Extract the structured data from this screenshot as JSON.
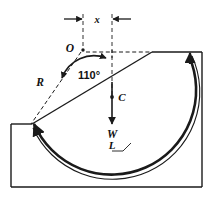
{
  "figure": {
    "name": "circular-slip-surface-diagram",
    "background_color": "#ffffff",
    "line_color": "#1a1a1a",
    "labels": {
      "center_point": "O",
      "radius": "R",
      "angle": "110°",
      "offset_dimension": "x",
      "centroid": "C",
      "weight": "W",
      "arc_length": "L"
    },
    "annotations": [
      {
        "id": "center-point-label",
        "text": "O",
        "x": 75,
        "y": 48
      },
      {
        "id": "radius-label",
        "text": "R",
        "x": 42,
        "y": 83
      },
      {
        "id": "angle-label",
        "text": "110°",
        "x": 89,
        "y": 76
      },
      {
        "id": "offset-label",
        "text": "x",
        "x": 97,
        "y": 22
      },
      {
        "id": "centroid-label",
        "text": "C",
        "x": 122,
        "y": 100
      },
      {
        "id": "weight-label",
        "text": "W",
        "x": 117,
        "y": 128
      },
      {
        "id": "arclength-label",
        "text": "L",
        "x": 115,
        "y": 154
      }
    ],
    "geometry": {
      "circle_center": {
        "x": 83,
        "y": 50
      },
      "radius_px": 76,
      "arc_start": {
        "x": 31,
        "y": 124
      },
      "arc_end": {
        "x": 189,
        "y": 52
      },
      "slope_top_vertex": {
        "x": 152,
        "y": 52
      },
      "ground_left_edge_y": 124,
      "block_left_x": 11,
      "block_right_x": 202,
      "block_bottom_y": 187,
      "dimension_line_y": 19,
      "dimension_left_x": 83,
      "dimension_right_x": 112
    }
  }
}
